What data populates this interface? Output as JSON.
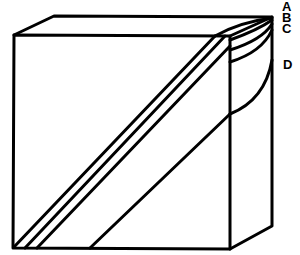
{
  "diagram": {
    "type": "block diagram of layered cube with diagonal planes",
    "labels": [
      {
        "id": "A",
        "text": "A",
        "x": 282,
        "y": 0
      },
      {
        "id": "B",
        "text": "B",
        "x": 282,
        "y": 11
      },
      {
        "id": "C",
        "text": "C",
        "x": 282,
        "y": 22
      },
      {
        "id": "D",
        "text": "D",
        "x": 283,
        "y": 58
      }
    ],
    "stroke_color": "#000000",
    "background": "#ffffff"
  }
}
